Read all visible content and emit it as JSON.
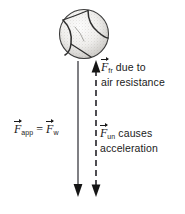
{
  "figure": {
    "background_color": "#ffffff",
    "ink_color": "#1a1a1a",
    "width": 185,
    "height": 214
  },
  "object": {
    "name": "baseball",
    "description": "stippled sphere with curved seam stitching",
    "center_x": 84,
    "center_y": 34,
    "radius": 26
  },
  "arrows": {
    "weight_arrow": {
      "style": "solid",
      "direction": "down",
      "x": 78,
      "y_top": 62,
      "y_bottom": 196
    },
    "unbalanced_arrow": {
      "style": "dashed",
      "direction": "up-and-down",
      "x": 96,
      "y_top": 62,
      "y_bottom": 196
    }
  },
  "labels": {
    "friction": {
      "symbol": "F",
      "subscript": "fr",
      "line1_after": " due to",
      "line2": "air resistance"
    },
    "unbalanced": {
      "symbol": "F",
      "subscript": "un",
      "line1_after": " causes",
      "line2": "acceleration"
    },
    "applied": {
      "symbol_left": "F",
      "subscript_left": "app",
      "equals": "=",
      "symbol_right": "F",
      "subscript_right": "w"
    }
  }
}
